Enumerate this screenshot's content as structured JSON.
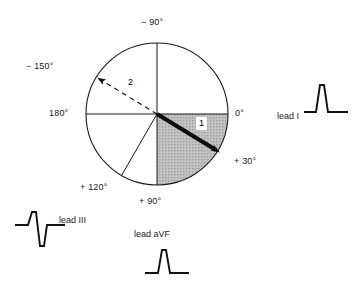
{
  "figure": {
    "type": "cardiac-axis-hexaxial-diagram",
    "title": "",
    "circle": {
      "cx": 157,
      "cy": 114,
      "r": 71
    }
  },
  "axis_labels": [
    {
      "id": "neg90",
      "text": "− 90°",
      "angle_deg": -90,
      "x": 141,
      "y": 17
    },
    {
      "id": "neg150",
      "text": "− 150°",
      "angle_deg": -150,
      "x": 26,
      "y": 61
    },
    {
      "id": "deg180",
      "text": "180°",
      "angle_deg": 180,
      "x": 49,
      "y": 108
    },
    {
      "id": "deg0",
      "text": "0°",
      "angle_deg": 0,
      "x": 235,
      "y": 108
    },
    {
      "id": "pos30",
      "text": "+ 30°",
      "angle_deg": 30,
      "x": 234,
      "y": 156
    },
    {
      "id": "pos90",
      "text": "+ 90°",
      "angle_deg": 90,
      "x": 139,
      "y": 196
    },
    {
      "id": "pos120",
      "text": "+ 120°",
      "angle_deg": 120,
      "x": 80,
      "y": 182
    }
  ],
  "vectors": [
    {
      "id": "vector-1",
      "label": "1",
      "style": "solid",
      "angle_deg": 30,
      "label_x": 196,
      "label_y": 117,
      "description": "bold solid mean QRS axis arrow at +30 degrees"
    },
    {
      "id": "vector-2",
      "label": "2",
      "style": "dashed",
      "angle_deg": -150,
      "label_x": 125,
      "label_y": 76,
      "description": "dashed arrow at -150 degrees"
    }
  ],
  "shaded_sector": {
    "id": "normal-axis-sector",
    "from_deg": 0,
    "to_deg": 90,
    "fill": "#b8b8b8"
  },
  "leads": [
    {
      "id": "lead-1",
      "label": "lead I",
      "label_x": 277,
      "label_y": 111,
      "trace": "tall-positive-R",
      "trace_x": 303,
      "trace_y": 79
    },
    {
      "id": "lead-3",
      "label": "lead III",
      "label_x": 59,
      "label_y": 215,
      "trace": "rS-biphasic",
      "trace_x": 14,
      "trace_y": 207
    },
    {
      "id": "lead-avf",
      "label": "lead aVF",
      "label_x": 134,
      "label_y": 229,
      "trace": "tall-positive-R",
      "trace_x": 144,
      "trace_y": 245
    }
  ],
  "colors": {
    "ink": "#111111",
    "sector_gray": "#b8b8b8",
    "circle_stroke": "#1a1a1a"
  }
}
